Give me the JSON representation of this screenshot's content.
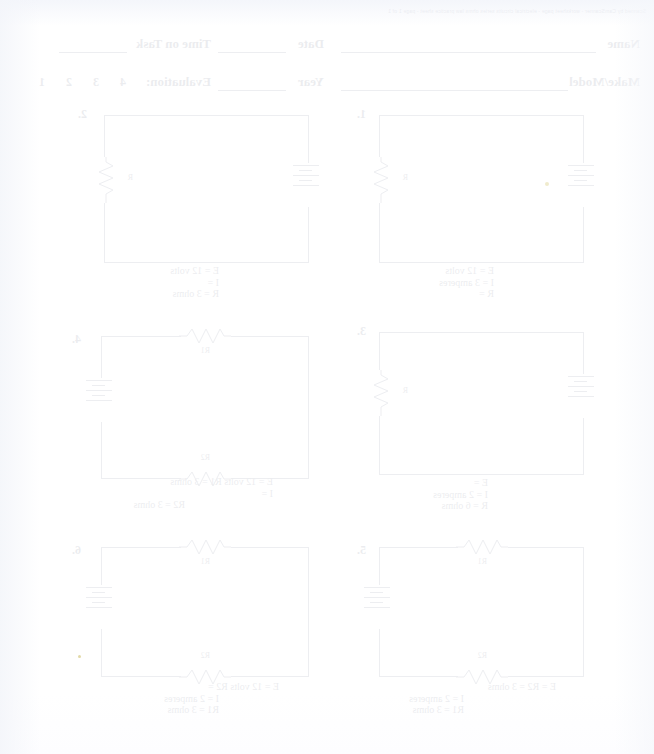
{
  "document": {
    "title": "Series Circuits Ohm's Law Worksheet",
    "orientation": "mirrored-scan",
    "scan_strip_text": "Scanned by CamScanner  -  worksheet page  -  electrical circuits series ohms law practice sheet  -  page 1 of 1"
  },
  "header": {
    "fields": [
      {
        "label": "Name",
        "value": ""
      },
      {
        "label": "Date",
        "value": ""
      },
      {
        "label": "Time on Task",
        "value": ""
      },
      {
        "label": "Make/Model",
        "value": ""
      },
      {
        "label": "Year",
        "value": ""
      },
      {
        "label": "Evaluation:",
        "value": ""
      }
    ],
    "evaluation_scale": "4   3   2   1"
  },
  "circuits": [
    {
      "number": "1.",
      "layout": "single-resistor-left",
      "components": {
        "battery": "battery-symbol",
        "resistors": [
          "R"
        ]
      },
      "labels": [
        "E =  12 volts",
        "I  =  3 amperes",
        "R ="
      ],
      "resistor_tags": [
        "R"
      ]
    },
    {
      "number": "2.",
      "layout": "single-resistor-left",
      "components": {
        "battery": "battery-symbol",
        "resistors": [
          "R"
        ]
      },
      "labels": [
        "E =  12 volts",
        "I  =",
        "R =  3 ohms"
      ],
      "resistor_tags": [
        "R"
      ]
    },
    {
      "number": "3.",
      "layout": "single-resistor-left",
      "components": {
        "battery": "battery-symbol",
        "resistors": [
          "R"
        ]
      },
      "labels": [
        "E =",
        "I  =  2 amperes",
        "R =  6 ohms"
      ],
      "resistor_tags": [
        "R"
      ]
    },
    {
      "number": "4.",
      "layout": "two-resistors-top-bottom",
      "components": {
        "battery": "battery-symbol",
        "resistors": [
          "R1",
          "R2"
        ]
      },
      "labels": [
        "E =  12 volts        R1 =  3 ohms",
        "I  =",
        "R2 =  3 ohms"
      ],
      "resistor_tags": [
        "R1",
        "R2"
      ]
    },
    {
      "number": "5.",
      "layout": "two-resistors-top-bottom",
      "components": {
        "battery": "battery-symbol",
        "resistors": [
          "R1",
          "R2"
        ]
      },
      "labels": [
        "E =                      R2 =  3 ohms",
        "I  =  2 amperes",
        "R1 =  3 ohms"
      ],
      "resistor_tags": [
        "R1",
        "R2"
      ]
    },
    {
      "number": "6.",
      "layout": "two-resistors-top-bottom",
      "components": {
        "battery": "battery-symbol",
        "resistors": [
          "R1",
          "R2"
        ]
      },
      "labels": [
        "E =  12 volts        R2 =",
        "I  =  2 amperes",
        "R1 =  3 ohms"
      ],
      "resistor_tags": [
        "R1",
        "R2"
      ]
    }
  ],
  "colors": {
    "ink": "#283250",
    "paper": "#ffffff",
    "rule": "#3b4765"
  }
}
